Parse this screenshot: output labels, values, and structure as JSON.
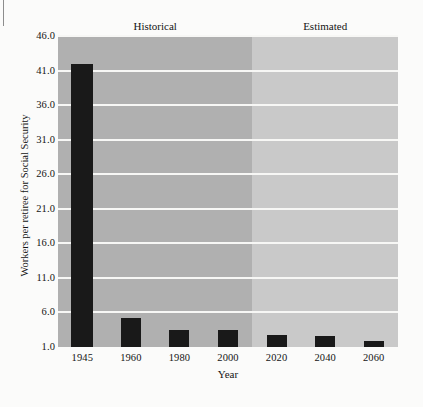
{
  "chart_data": {
    "type": "bar",
    "title": "",
    "xlabel": "Year",
    "ylabel": "Workers per retiree for Social Security",
    "categories": [
      "1945",
      "1960",
      "1980",
      "2000",
      "2020",
      "2040",
      "2060"
    ],
    "values": [
      41.9,
      5.2,
      3.4,
      3.5,
      2.8,
      2.6,
      1.9
    ],
    "ylim": [
      1.0,
      46.0
    ],
    "yticks": [
      "1.0",
      "6.0",
      "11.0",
      "16.0",
      "21.0",
      "26.0",
      "31.0",
      "36.0",
      "41.0",
      "46.0"
    ],
    "ytick_values": [
      1.0,
      6.0,
      11.0,
      16.0,
      21.0,
      26.0,
      31.0,
      36.0,
      41.0,
      46.0
    ],
    "xticks": [
      "1945",
      "1960",
      "1980",
      "2000",
      "2020",
      "2040",
      "2060"
    ],
    "grid": true,
    "legend_position": "above-plot",
    "regions": [
      {
        "name": "Historical",
        "label": "Historical",
        "categories": [
          "1945",
          "1960",
          "1980",
          "2000"
        ],
        "color": "#b0b0b0"
      },
      {
        "name": "Estimated",
        "label": "Estimated",
        "categories": [
          "2020",
          "2040",
          "2060"
        ],
        "color": "#c9c9c9"
      }
    ],
    "bar_color": "#191919",
    "gridline_color": "#f7f7f5",
    "background_color": "#fbfbfa"
  }
}
